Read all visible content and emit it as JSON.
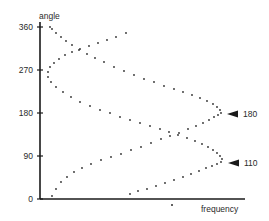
{
  "chart_data": {
    "type": "scatter",
    "title": "",
    "xlabel": "frequency",
    "ylabel": "angle",
    "y_ticks": [
      "0",
      "90",
      "180",
      "270",
      "360"
    ],
    "ylim": [
      0,
      360
    ],
    "grid": false,
    "legend": null,
    "annotations": [
      {
        "text": "180",
        "marker": "left-pointing arrowhead",
        "points_to": "rightmost turn of curve peaking at angle 180"
      },
      {
        "text": "110",
        "marker": "left-pointing arrowhead",
        "points_to": "rightmost turn of curve peaking at angle ~110"
      }
    ],
    "series": [
      {
        "name": "180",
        "style": "dotted",
        "description": "sinusoidal dotted curve starting near frequency minimum at angle 0, reaching maximum frequency at angle 180 and returning to minimum at angle 360",
        "points_px": [
          [
            52,
            196
          ],
          [
            56,
            189
          ],
          [
            61,
            182
          ],
          [
            67,
            177
          ],
          [
            74,
            172
          ],
          [
            82,
            168
          ],
          [
            91,
            164
          ],
          [
            101,
            160
          ],
          [
            111,
            157
          ],
          [
            121,
            154
          ],
          [
            131,
            150
          ],
          [
            141,
            147
          ],
          [
            151,
            143
          ],
          [
            161,
            139
          ],
          [
            170,
            136
          ],
          [
            179,
            133
          ],
          [
            188,
            129
          ],
          [
            196,
            126
          ],
          [
            203,
            123
          ],
          [
            209,
            120
          ],
          [
            214,
            117
          ],
          [
            218,
            115
          ],
          [
            221,
            113
          ],
          [
            220,
            110
          ],
          [
            217,
            107
          ],
          [
            213,
            104
          ],
          [
            207,
            101
          ],
          [
            200,
            98
          ],
          [
            192,
            95
          ],
          [
            183,
            92
          ],
          [
            174,
            89
          ],
          [
            164,
            86
          ],
          [
            154,
            82
          ],
          [
            144,
            79
          ],
          [
            134,
            75
          ],
          [
            124,
            71
          ],
          [
            114,
            67
          ],
          [
            104,
            62
          ],
          [
            95,
            58
          ],
          [
            87,
            54
          ],
          [
            79,
            50
          ],
          [
            72,
            45
          ],
          [
            66,
            41
          ],
          [
            61,
            37
          ],
          [
            56,
            33
          ],
          [
            52,
            29
          ],
          [
            50,
            27
          ]
        ]
      },
      {
        "name": "110",
        "style": "dotted",
        "description": "sinusoidal dotted curve with maximum frequency near angle 110 and minimum near angle 290",
        "points_px": [
          [
            130,
            194
          ],
          [
            138,
            191
          ],
          [
            147,
            189
          ],
          [
            156,
            186
          ],
          [
            165,
            183
          ],
          [
            174,
            180
          ],
          [
            183,
            177
          ],
          [
            191,
            174
          ],
          [
            199,
            171
          ],
          [
            206,
            168
          ],
          [
            212,
            166
          ],
          [
            217,
            164
          ],
          [
            221,
            162
          ],
          [
            222,
            159
          ],
          [
            220,
            156
          ],
          [
            217,
            153
          ],
          [
            213,
            150
          ],
          [
            208,
            147
          ],
          [
            202,
            144
          ],
          [
            195,
            141
          ],
          [
            187,
            138
          ],
          [
            178,
            135
          ],
          [
            169,
            132
          ],
          [
            160,
            129
          ],
          [
            150,
            126
          ],
          [
            140,
            123
          ],
          [
            130,
            120
          ],
          [
            120,
            117
          ],
          [
            110,
            113
          ],
          [
            100,
            110
          ],
          [
            90,
            106
          ],
          [
            80,
            102
          ],
          [
            71,
            97
          ],
          [
            63,
            92
          ],
          [
            56,
            87
          ],
          [
            51,
            82
          ],
          [
            48,
            77
          ],
          [
            48,
            72
          ],
          [
            50,
            67
          ],
          [
            54,
            63
          ],
          [
            59,
            59
          ],
          [
            65,
            55
          ],
          [
            72,
            52
          ],
          [
            80,
            49
          ],
          [
            89,
            46
          ],
          [
            98,
            43
          ],
          [
            107,
            40
          ],
          [
            116,
            37
          ],
          [
            126,
            33
          ]
        ]
      }
    ],
    "stray_marks_px": [
      [
        172,
        205
      ]
    ]
  },
  "axes": {
    "y_label": "angle",
    "x_label": "frequency",
    "ticks": [
      {
        "label": "360",
        "y": 27
      },
      {
        "label": "270",
        "y": 70
      },
      {
        "label": "180",
        "y": 113
      },
      {
        "label": "90",
        "y": 156
      },
      {
        "label": "0",
        "y": 199
      }
    ]
  },
  "annotations": {
    "a180": "180",
    "a110": "110"
  }
}
